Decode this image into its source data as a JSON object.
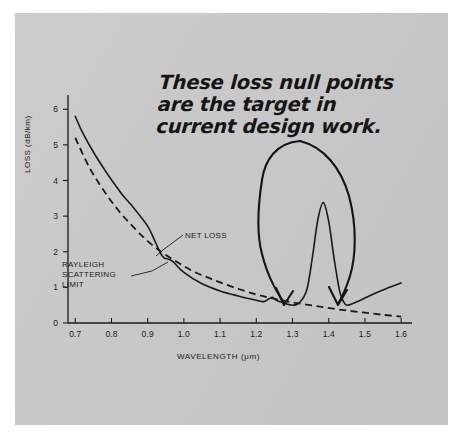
{
  "figure": {
    "background_color": "#c9c9c9",
    "page_color": "#ffffff",
    "ink_color": "#1a1a1a"
  },
  "annotation": {
    "handwritten_note": "These loss null points are the target in current design work.",
    "net_loss_label": "NET LOSS",
    "rayleigh_label_line1": "RAYLEIGH",
    "rayleigh_label_line2": "SCATTERING",
    "rayleigh_label_line3": "LIMIT",
    "arrow_targets": [
      1.3,
      1.45
    ]
  },
  "chart_data": {
    "type": "line",
    "title": "",
    "xlabel": "WAVELENGTH (μm)",
    "ylabel": "LOSS (dB/km)",
    "xlim": [
      0.68,
      1.63
    ],
    "ylim": [
      0,
      6.4
    ],
    "xticks": [
      0.7,
      0.8,
      0.9,
      1.0,
      1.1,
      1.2,
      1.3,
      1.4,
      1.5,
      1.6
    ],
    "xtick_labels": [
      "0.7",
      "0.8",
      "0.9",
      "1.0",
      "1.1",
      "1.2",
      "1.3",
      "1.4",
      "1.5",
      "1.6"
    ],
    "yticks": [
      0,
      1,
      2,
      3,
      4,
      5,
      6
    ],
    "ytick_labels": [
      "0",
      "1",
      "2",
      "3",
      "4",
      "5",
      "6"
    ],
    "grid": false,
    "legend": "inline-annotations",
    "series": [
      {
        "name": "NET LOSS",
        "style": "solid",
        "x": [
          0.7,
          0.72,
          0.75,
          0.78,
          0.8,
          0.83,
          0.86,
          0.9,
          0.92,
          0.935,
          0.945,
          0.955,
          0.97,
          1.0,
          1.05,
          1.1,
          1.15,
          1.2,
          1.22,
          1.235,
          1.245,
          1.255,
          1.27,
          1.3,
          1.32,
          1.34,
          1.355,
          1.37,
          1.385,
          1.4,
          1.415,
          1.43,
          1.44,
          1.45,
          1.47,
          1.5,
          1.53,
          1.56,
          1.6
        ],
        "y": [
          5.8,
          5.35,
          4.8,
          4.32,
          4.02,
          3.6,
          3.25,
          2.72,
          2.3,
          1.97,
          1.83,
          1.8,
          1.72,
          1.42,
          1.1,
          0.9,
          0.76,
          0.64,
          0.6,
          0.68,
          0.72,
          0.64,
          0.58,
          0.5,
          0.58,
          0.95,
          1.85,
          2.9,
          3.38,
          2.85,
          1.8,
          0.9,
          0.62,
          0.5,
          0.56,
          0.7,
          0.84,
          0.97,
          1.12
        ]
      },
      {
        "name": "RAYLEIGH SCATTERING LIMIT",
        "style": "dashed",
        "x": [
          0.7,
          0.74,
          0.78,
          0.82,
          0.86,
          0.9,
          0.94,
          0.98,
          1.02,
          1.06,
          1.1,
          1.15,
          1.2,
          1.25,
          1.3,
          1.35,
          1.4,
          1.45,
          1.5,
          1.55,
          1.6
        ],
        "y": [
          5.2,
          4.35,
          3.7,
          3.15,
          2.7,
          2.3,
          1.98,
          1.72,
          1.48,
          1.3,
          1.14,
          0.96,
          0.8,
          0.68,
          0.58,
          0.5,
          0.42,
          0.35,
          0.29,
          0.23,
          0.18
        ]
      }
    ]
  }
}
